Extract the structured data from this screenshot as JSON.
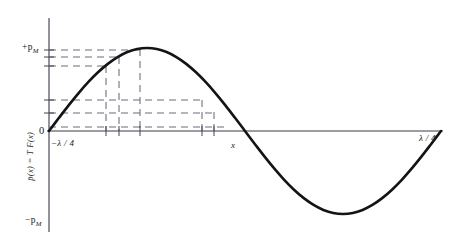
{
  "figure": {
    "kind": "line-plot",
    "background_color": "#ffffff",
    "curve_color": "#141414",
    "axis_color": "#3a3a48",
    "dash_color": "#6a6a78"
  },
  "labels": {
    "y_axis_title": "p̄(x) = T F(x)",
    "y_max": "+p",
    "y_max_sub": "M",
    "y_min": "−p",
    "y_min_sub": "M",
    "origin": "0",
    "x_left": "−λ / 4",
    "x_right": "λ / 4",
    "x_point": "x"
  },
  "chart_data": {
    "type": "line",
    "title": "",
    "xlabel": "",
    "ylabel": "p̄(x) = T F(x)",
    "grid": false,
    "legend": null,
    "xlim": [
      0,
      1
    ],
    "ylim": [
      -1,
      1
    ],
    "x_tick_labels": [
      "−λ / 4",
      "x",
      "λ / 4"
    ],
    "x_tick_values": [
      0.0,
      0.5,
      1.0
    ],
    "y_tick_labels": [
      "+p_M",
      "0",
      "−p_M"
    ],
    "y_tick_values": [
      1,
      0,
      -1
    ],
    "series": [
      {
        "name": "p̄(x) = T F(x)",
        "comment": "one full sine period: y = sin(2πx) over x in [0,1]",
        "x": [
          0.0,
          0.025,
          0.05,
          0.075,
          0.1,
          0.125,
          0.15,
          0.175,
          0.2,
          0.225,
          0.25,
          0.275,
          0.3,
          0.325,
          0.35,
          0.375,
          0.4,
          0.425,
          0.45,
          0.475,
          0.5,
          0.525,
          0.55,
          0.575,
          0.6,
          0.625,
          0.65,
          0.675,
          0.7,
          0.725,
          0.75,
          0.775,
          0.8,
          0.825,
          0.85,
          0.875,
          0.9,
          0.925,
          0.95,
          0.975,
          1.0
        ],
        "y": [
          0.0,
          0.156,
          0.309,
          0.454,
          0.588,
          0.707,
          0.809,
          0.891,
          0.951,
          0.988,
          1.0,
          0.988,
          0.951,
          0.891,
          0.809,
          0.707,
          0.588,
          0.454,
          0.309,
          0.156,
          0.0,
          -0.156,
          -0.309,
          -0.454,
          -0.588,
          -0.707,
          -0.809,
          -0.891,
          -0.951,
          -0.988,
          -1.0,
          -0.988,
          -0.951,
          -0.891,
          -0.809,
          -0.707,
          -0.588,
          -0.454,
          -0.309,
          -0.156,
          0.0
        ]
      }
    ],
    "construction_lines": {
      "comment": "dashed projection lines from the curve to both axes",
      "horizontal_y_values": [
        0.955,
        0.872,
        0.78,
        0.405,
        0.265,
        0.055
      ],
      "vertical_x_values": [
        0.155,
        0.19,
        0.225,
        0.415,
        0.45
      ]
    },
    "annotations": [
      {
        "text": "+p_M",
        "x": 0.0,
        "y": 1.0
      },
      {
        "text": "−p_M",
        "x": 0.0,
        "y": -1.0
      },
      {
        "text": "0",
        "x": 0.0,
        "y": 0.0
      },
      {
        "text": "−λ / 4",
        "x": 0.0,
        "y": 0.0
      },
      {
        "text": "x",
        "x": 0.5,
        "y": 0.0
      },
      {
        "text": "λ / 4",
        "x": 1.0,
        "y": 0.0
      }
    ]
  }
}
